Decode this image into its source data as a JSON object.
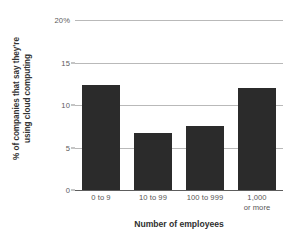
{
  "chart_data": {
    "type": "bar",
    "title": "",
    "xlabel": "Number of employees",
    "ylabel_lines": [
      "% of companies that say they're",
      "using cloud computing"
    ],
    "ylabel": "% of companies that say they're using cloud computing",
    "categories": [
      "0 to 9",
      "10 to 99",
      "100 to 999",
      "1,000 or more"
    ],
    "category_lines": [
      [
        "0 to 9"
      ],
      [
        "10 to 99"
      ],
      [
        "100 to 999"
      ],
      [
        "1,000",
        "or more"
      ]
    ],
    "values": [
      12.4,
      6.7,
      7.5,
      12.0
    ],
    "ylim": [
      0,
      20
    ],
    "yticks": [
      0,
      5,
      10,
      15,
      20
    ],
    "ytick_labels": [
      "0",
      "5",
      "10",
      "15",
      "20%"
    ],
    "grid": true,
    "legend": "none",
    "colors": {
      "bar": "#2b2b2b",
      "gridline": "#b9b9b9",
      "axis": "#5d5d5d",
      "tick_text": "#5a5a5a",
      "title_text": "#2f2f2f",
      "background": "#ffffff"
    }
  }
}
